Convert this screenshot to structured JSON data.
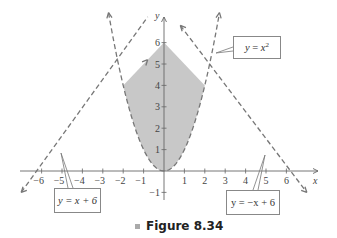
{
  "chart_data": {
    "type": "line",
    "title": "Figure 8.34",
    "xlabel": "x",
    "ylabel": "y",
    "xlim": [
      -6.5,
      6.5
    ],
    "ylim": [
      -1.5,
      6.5
    ],
    "x_ticks": [
      -6,
      -5,
      -4,
      -3,
      -2,
      -1,
      1,
      2,
      3,
      4,
      5,
      6
    ],
    "y_ticks": [
      -1,
      1,
      2,
      3,
      4,
      5,
      6
    ],
    "grid": false,
    "series": [
      {
        "name": "y = x^2",
        "style": "dashed",
        "equation": "x^2"
      },
      {
        "name": "y = x + 6",
        "style": "dashed",
        "equation": "x+6"
      },
      {
        "name": "y = -x + 6",
        "style": "dashed",
        "equation": "-x+6"
      }
    ],
    "shaded_region": {
      "description": "Region between y = x^2 (below) and min(x+6, -x+6) (above)",
      "vertices": [
        [
          -2,
          4
        ],
        [
          0,
          6
        ],
        [
          2,
          4
        ]
      ],
      "lower_bound": "y = x^2",
      "fill": "#c8c8c8"
    },
    "intersections": [
      [
        -2,
        4
      ],
      [
        0,
        6
      ],
      [
        2,
        4
      ]
    ],
    "annotations": [
      "y = x^2",
      "y = x + 6",
      "y = -x + 6"
    ]
  },
  "labels": {
    "eq_parabola": {
      "y": "y",
      "eq": " = ",
      "x": "x",
      "exp": "2"
    },
    "eq_left_line": "y = x + 6",
    "eq_right_line": "y = −x + 6",
    "x_axis": "x",
    "y_axis": "y"
  },
  "caption": {
    "text": "Figure 8.34"
  }
}
